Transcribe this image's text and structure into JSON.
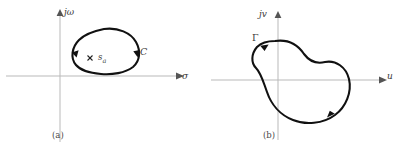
{
  "figure": {
    "panels": [
      {
        "id": "a",
        "caption": "(a)",
        "plane": "s-plane",
        "axes": {
          "horizontal_label": "σ",
          "vertical_label": "jω"
        },
        "contour_label": "C",
        "contour_direction": "clockwise",
        "pole_marker": "×",
        "pole_label": "s",
        "pole_subscript": "a"
      },
      {
        "id": "b",
        "caption": "(b)",
        "plane": "w-plane",
        "axes": {
          "horizontal_label": "u",
          "vertical_label": "jv"
        },
        "contour_label": "Γ",
        "contour_direction": "clockwise"
      }
    ],
    "colors": {
      "contour": "#111111",
      "axis": "#b9b9b9",
      "text": "#3a3a3a",
      "background": "#ffffff"
    }
  }
}
